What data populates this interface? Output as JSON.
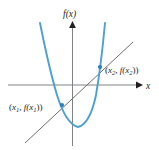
{
  "figure": {
    "background_color": "#ffffff"
  },
  "axes": {
    "x_label": "x",
    "y_label": "f(x)",
    "axis_color": "#808285",
    "x_axis_y": 85,
    "y_axis_x": 72.5,
    "x_axis_start": 8,
    "x_axis_end": 140,
    "y_axis_top": 22,
    "y_axis_bottom": 145
  },
  "curve": {
    "name": "parabola",
    "color": "#4d9fd6",
    "stroke_width": 1.9,
    "vertex": [
      78,
      127
    ],
    "left_endpoint": [
      40,
      23
    ],
    "right_endpoint": [
      105,
      23
    ]
  },
  "secant": {
    "name": "secant-line",
    "color": "#6d6e71",
    "stroke_width": 1.0,
    "start": [
      25,
      143
    ],
    "end": [
      133,
      42
    ]
  },
  "points": [
    {
      "id": "point-1",
      "label_x": "x",
      "label_x_sub": "1",
      "label_f": "f(x",
      "label_f_sub": "1",
      "label_full": "(x1, f(x1))",
      "cx": 62,
      "cy": 105,
      "color": "#2b7fbf",
      "label_anchor_x": 10,
      "label_anchor_y": 108
    },
    {
      "id": "point-2",
      "label_x": "x",
      "label_x_sub": "2",
      "label_f": "f(x",
      "label_f_sub": "2",
      "label_full": "(x2, f(x2))",
      "cx": 100,
      "cy": 67,
      "color": "#2b7fbf",
      "label_anchor_x": 106,
      "label_anchor_y": 73
    }
  ],
  "colors": {
    "curve_blue": "#4d9fd6",
    "point_blue": "#2b7fbf",
    "axis_gray": "#808285",
    "line_gray": "#6d6e71",
    "text_black": "#231f20"
  }
}
